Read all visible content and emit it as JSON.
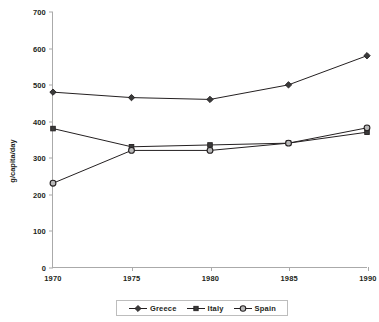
{
  "chart_data": {
    "type": "line",
    "title": "",
    "xlabel": "",
    "ylabel": "g/capita/day",
    "categories": [
      "1970",
      "1975",
      "1980",
      "1985",
      "1990"
    ],
    "x": [
      1970,
      1975,
      1980,
      1985,
      1990
    ],
    "xlim": [
      1970,
      1990
    ],
    "ylim": [
      0,
      700
    ],
    "yticks": [
      0,
      100,
      200,
      300,
      400,
      500,
      600,
      700
    ],
    "ytick_labels": [
      "0",
      "100",
      "200",
      "300",
      "400",
      "500",
      "600",
      "700"
    ],
    "grid": false,
    "legend_position": "bottom",
    "series": [
      {
        "name": "Greece",
        "marker": "diamond",
        "color": "#231f20",
        "values": [
          480,
          465,
          460,
          500,
          580
        ]
      },
      {
        "name": "Italy",
        "marker": "square",
        "color": "#231f20",
        "values": [
          380,
          330,
          335,
          340,
          370
        ]
      },
      {
        "name": "Spain",
        "marker": "circle",
        "color": "#231f20",
        "values": [
          230,
          320,
          320,
          340,
          382
        ]
      }
    ]
  },
  "legend": {
    "entries": [
      {
        "label": "Greece",
        "marker": "diamond"
      },
      {
        "label": "Italy",
        "marker": "square"
      },
      {
        "label": "Spain",
        "marker": "circle"
      }
    ]
  },
  "colors": {
    "line": "#231f20",
    "axis": "#aaaaaa",
    "marker_fill_dark": "#3a3a3a",
    "marker_fill_light": "#b8b8b8",
    "background": "#ffffff"
  }
}
